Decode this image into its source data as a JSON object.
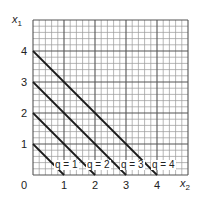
{
  "diagram": {
    "axes": {
      "x_title_var": "x",
      "x_title_sub": "2",
      "y_title_var": "x",
      "y_title_sub": "1",
      "origin_label": "0",
      "x_ticks": [
        "1",
        "2",
        "3",
        "4"
      ],
      "y_ticks": [
        "1",
        "2",
        "3",
        "4"
      ],
      "range": [
        0,
        5
      ]
    },
    "grid": {
      "major_step": 1,
      "minor_per_major": 5,
      "major_color": "#555555",
      "minor_color": "#9a9a9a"
    },
    "lines": [
      {
        "label": "q = 1",
        "q": 1
      },
      {
        "label": "q = 2",
        "q": 2
      },
      {
        "label": "q = 3",
        "q": 3
      },
      {
        "label": "q = 4",
        "q": 4
      }
    ],
    "line_color": "#1a1a1a"
  },
  "chart_data": {
    "type": "line",
    "title": "",
    "xlabel": "x2",
    "ylabel": "x1",
    "xlim": [
      0,
      5
    ],
    "ylim": [
      0,
      5
    ],
    "grid": true,
    "series": [
      {
        "name": "q = 1",
        "x": [
          0,
          1
        ],
        "y": [
          1,
          0
        ]
      },
      {
        "name": "q = 2",
        "x": [
          0,
          2
        ],
        "y": [
          2,
          0
        ]
      },
      {
        "name": "q = 3",
        "x": [
          0,
          3
        ],
        "y": [
          3,
          0
        ]
      },
      {
        "name": "q = 4",
        "x": [
          0,
          4
        ],
        "y": [
          4,
          0
        ]
      }
    ],
    "x_ticks": [
      0,
      1,
      2,
      3,
      4
    ],
    "y_ticks": [
      1,
      2,
      3,
      4
    ]
  }
}
